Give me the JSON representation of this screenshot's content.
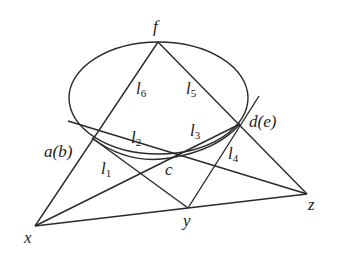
{
  "diagram": {
    "stroke_color": "#2a2a2a",
    "points": {
      "f": {
        "label": "f",
        "x": 158,
        "y": 42
      },
      "a": {
        "label": "a(b)",
        "x": 92,
        "y": 138
      },
      "d": {
        "label": "d(e)",
        "x": 240,
        "y": 124
      },
      "c": {
        "label": "c",
        "x": 170,
        "y": 158
      },
      "x": {
        "label": "x",
        "x": 35,
        "y": 226
      },
      "y": {
        "label": "y",
        "x": 188,
        "y": 208
      },
      "z": {
        "label": "z",
        "x": 307,
        "y": 194
      }
    },
    "lines": {
      "l1": {
        "name": "l",
        "sub": "1"
      },
      "l2": {
        "name": "l",
        "sub": "2"
      },
      "l3": {
        "name": "l",
        "sub": "3"
      },
      "l4": {
        "name": "l",
        "sub": "4"
      },
      "l5": {
        "name": "l",
        "sub": "5"
      },
      "l6": {
        "name": "l",
        "sub": "6"
      }
    }
  }
}
